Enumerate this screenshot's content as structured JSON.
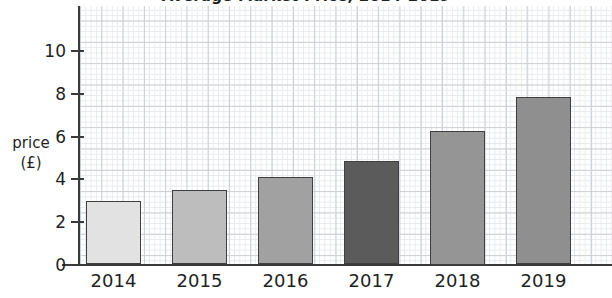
{
  "chart_data": {
    "type": "bar",
    "title": "Average Market Price, 2014-2019",
    "xlabel": "",
    "ylabel": "price (£)",
    "categories": [
      "2014",
      "2015",
      "2016",
      "2017",
      "2018",
      "2019"
    ],
    "values": [
      3.0,
      3.5,
      4.1,
      4.85,
      6.25,
      7.85
    ],
    "ylim": [
      0,
      11
    ],
    "yticks": [
      0,
      2,
      4,
      6,
      8,
      10
    ],
    "ytick_labels": [
      "0",
      "2",
      "4",
      "6",
      "8",
      "10"
    ],
    "grid": true,
    "grid_style": "graph-paper",
    "legend": null,
    "bar_colors": [
      "#e2e2e2",
      "#bdbdbd",
      "#a1a1a1",
      "#5b5b5b",
      "#959595",
      "#8f8f8f"
    ],
    "bar_border_color": "#3f3f3f"
  },
  "axis": {
    "y_title_line1": "price",
    "y_title_line2": "(£)"
  }
}
